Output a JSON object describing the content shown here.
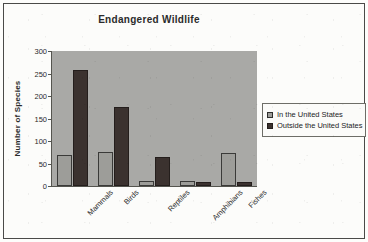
{
  "chart_data": {
    "type": "bar",
    "title": "Endangered Wildlife",
    "xlabel": "",
    "ylabel": "Number of Species",
    "categories": [
      "Mammals",
      "Birds",
      "Reptiles",
      "Amphibians",
      "Fishes"
    ],
    "series": [
      {
        "name": "In the United States",
        "values": [
          69,
          76,
          12,
          12,
          73
        ],
        "color": "#9d9d99"
      },
      {
        "name": "Outside the United States",
        "values": [
          258,
          176,
          64,
          8,
          10
        ],
        "color": "#3b322f"
      }
    ],
    "ylim": [
      0,
      300
    ],
    "yticks": [
      0,
      50,
      100,
      150,
      200,
      250,
      300
    ],
    "ytick_labels": [
      "0",
      "50",
      "100",
      "150",
      "200",
      "250",
      "300"
    ],
    "grid": false,
    "legend_position": "right",
    "plot_background": "#a9a9a6",
    "axis_color": "#55554f",
    "text_color": "#2b2b2b"
  }
}
